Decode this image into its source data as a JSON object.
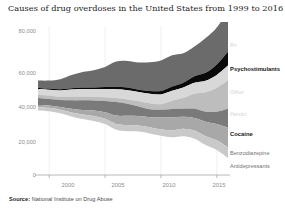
{
  "title": "Causes of drug overdoses in the United States from 1999 to 2016",
  "source": {
    "prefix": "Source:",
    "text": "National Institute on Drug Abuse"
  },
  "axes": {
    "y_ticks": [
      "0",
      "20,000",
      "40,000",
      "60,000",
      "80,000"
    ],
    "x_ticks": [
      "2000",
      "2005",
      "2010",
      "2015"
    ]
  },
  "series_labels": {
    "rx": "Rx",
    "psychostimulants": "Psychostimulants",
    "other": "Other",
    "heroin": "Heroin",
    "cocaine": "Cocaine",
    "benzodiazepine": "Benzodiazepine",
    "antidepressants": "Antidepressants"
  },
  "colors": {
    "rx": "#6b6b6b",
    "psychostimulants": "#0a0a0a",
    "other": "#d8d8d8",
    "heroin": "#bdbdbd",
    "cocaine": "#7a7a7a",
    "benzodiazepine": "#a8a8a8",
    "antidepressants": "#c9c9c9",
    "axis": "#b0b0b0",
    "grid": "#ececec",
    "tick_text": "#8c8c8c"
  },
  "chart_data": {
    "type": "area",
    "variant": "streamgraph-diverging",
    "title": "Causes of drug overdoses in the United States from 1999 to 2016",
    "xlabel": "",
    "ylabel": "",
    "ylim": [
      0,
      80000
    ],
    "y_ticks": [
      0,
      20000,
      40000,
      60000,
      80000
    ],
    "x": [
      1999,
      2000,
      2001,
      2002,
      2003,
      2004,
      2005,
      2006,
      2007,
      2008,
      2009,
      2010,
      2011,
      2012,
      2013,
      2014,
      2015,
      2016
    ],
    "x_ticks": [
      2000,
      2005,
      2010,
      2015
    ],
    "grid": "vertical-faint",
    "legend_position": "right-inline",
    "series": [
      {
        "name": "Rx",
        "color": "#6b6b6b",
        "values": [
          4000,
          4400,
          5500,
          7200,
          8500,
          9400,
          10900,
          13700,
          14400,
          14800,
          15600,
          16650,
          17000,
          16000,
          16200,
          18900,
          20100,
          22500
        ]
      },
      {
        "name": "Psychostimulants",
        "color": "#0a0a0a",
        "values": [
          550,
          600,
          650,
          700,
          800,
          900,
          1100,
          1400,
          1500,
          1300,
          1600,
          1850,
          2250,
          2600,
          3600,
          4300,
          5700,
          7500
        ]
      },
      {
        "name": "Other",
        "color": "#d8d8d8",
        "values": [
          3000,
          3200,
          3400,
          3800,
          4100,
          4300,
          4500,
          4800,
          5000,
          4900,
          5100,
          5300,
          5500,
          5600,
          5900,
          6300,
          7000,
          8000
        ]
      },
      {
        "name": "Heroin",
        "color": "#bdbdbd",
        "values": [
          1960,
          1840,
          1780,
          2090,
          2080,
          1880,
          2010,
          2090,
          2400,
          3040,
          3280,
          3040,
          4400,
          5930,
          8260,
          10570,
          12990,
          15470
        ]
      },
      {
        "name": "Cocaine",
        "color": "#7a7a7a",
        "values": [
          3820,
          3540,
          3830,
          4600,
          5200,
          5450,
          6210,
          7450,
          6510,
          5130,
          4350,
          4180,
          4680,
          4400,
          4940,
          5420,
          6780,
          10370
        ]
      },
      {
        "name": "Benzodiazepine",
        "color": "#a8a8a8",
        "values": [
          1135,
          1300,
          1500,
          2000,
          2500,
          3000,
          3500,
          4500,
          5000,
          5100,
          5400,
          6500,
          7000,
          6500,
          6900,
          7900,
          8800,
          10700
        ]
      },
      {
        "name": "Antidepressants",
        "color": "#c9c9c9",
        "values": [
          1750,
          1800,
          1900,
          2200,
          2500,
          2700,
          2900,
          3200,
          3400,
          3300,
          3400,
          3500,
          3800,
          4100,
          4400,
          4800,
          5300,
          5800
        ]
      }
    ]
  }
}
